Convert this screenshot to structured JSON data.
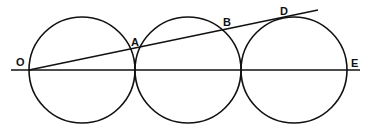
{
  "diagram": {
    "colors": {
      "stroke": "#111111",
      "background": "#ffffff"
    },
    "circles": [
      {
        "id": "c1",
        "cx": 82,
        "cy": 70,
        "r": 53
      },
      {
        "id": "c2",
        "cx": 188,
        "cy": 70,
        "r": 53
      },
      {
        "id": "c3",
        "cx": 294,
        "cy": 70,
        "r": 53
      }
    ],
    "lines": [
      {
        "id": "baseline",
        "x1": 11,
        "y1": 70,
        "x2": 360,
        "y2": 70
      },
      {
        "id": "tangent-line",
        "x1": 29,
        "y1": 70,
        "x2": 318,
        "y2": 10
      }
    ],
    "labels": [
      {
        "id": "O",
        "text": "O",
        "x": 16,
        "y": 66
      },
      {
        "id": "A",
        "text": "A",
        "x": 131,
        "y": 46
      },
      {
        "id": "B",
        "text": "B",
        "x": 223,
        "y": 26
      },
      {
        "id": "D",
        "text": "D",
        "x": 280,
        "y": 15
      },
      {
        "id": "E",
        "text": "E",
        "x": 351,
        "y": 67
      }
    ]
  }
}
